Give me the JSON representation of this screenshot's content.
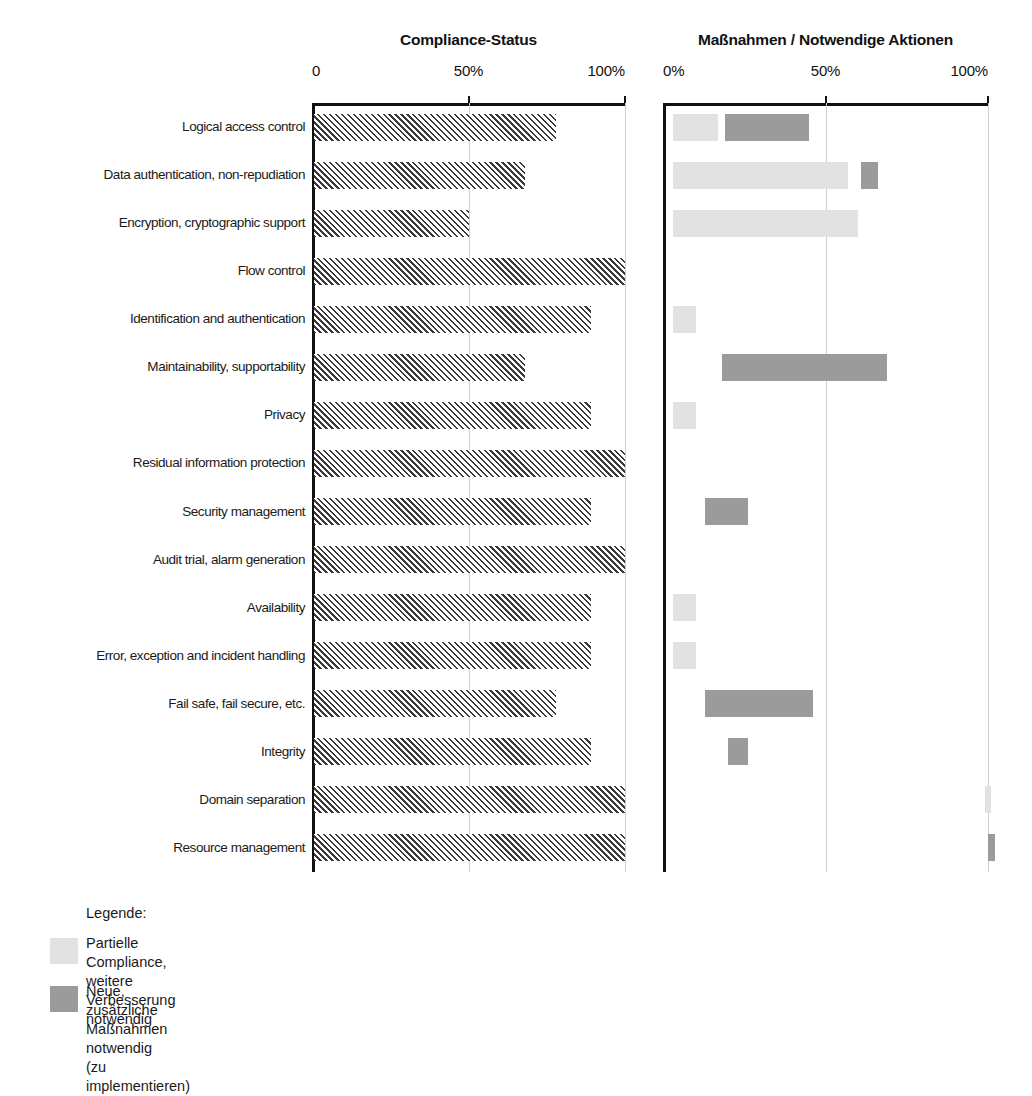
{
  "chart_data": {
    "type": "bar",
    "title": "",
    "orientation": "horizontal",
    "panels": [
      {
        "id": "compliance",
        "title": "Compliance-Status",
        "xlabel": "",
        "ylabel": "",
        "xlim": [
          0,
          100
        ],
        "ticks": [
          {
            "value": 0,
            "label": "0"
          },
          {
            "value": 50,
            "label": "50%"
          },
          {
            "value": 100,
            "label": "100%"
          }
        ],
        "grid": true,
        "series": [
          {
            "name": "Compliance-Status",
            "style": "hatched",
            "values": [
              78,
              68,
              50,
              100,
              89,
              68,
              89,
              100,
              89,
              100,
              89,
              89,
              78,
              89,
              100,
              100
            ]
          }
        ]
      },
      {
        "id": "massnahmen",
        "title": "Maßnahmen / Notwendige Aktionen",
        "xlabel": "",
        "ylabel": "",
        "xlim": [
          0,
          100
        ],
        "ticks": [
          {
            "value": 0,
            "label": "0%"
          },
          {
            "value": 50,
            "label": "50%"
          },
          {
            "value": 100,
            "label": "100%"
          }
        ],
        "grid": true,
        "series": [
          {
            "name": "Partielle Compliance, weitere Verbesserung notwendig",
            "style": "light",
            "bars": [
              {
                "row": 0,
                "start": 3,
                "end": 17
              },
              {
                "row": 1,
                "start": 3,
                "end": 57
              },
              {
                "row": 2,
                "start": 3,
                "end": 60
              },
              {
                "row": 4,
                "start": 3,
                "end": 10
              },
              {
                "row": 6,
                "start": 3,
                "end": 10
              },
              {
                "row": 10,
                "start": 3,
                "end": 10
              },
              {
                "row": 11,
                "start": 3,
                "end": 10
              },
              {
                "row": 14,
                "start": 99,
                "end": 101
              }
            ]
          },
          {
            "name": "Neue, zusätzliche Maßnahmen notwendig (zu implementieren)",
            "style": "dark",
            "bars": [
              {
                "row": 0,
                "start": 19,
                "end": 45
              },
              {
                "row": 1,
                "start": 61,
                "end": 66
              },
              {
                "row": 5,
                "start": 18,
                "end": 69
              },
              {
                "row": 8,
                "start": 13,
                "end": 26
              },
              {
                "row": 12,
                "start": 13,
                "end": 46
              },
              {
                "row": 13,
                "start": 20,
                "end": 26
              },
              {
                "row": 15,
                "start": 100,
                "end": 102
              }
            ]
          }
        ]
      }
    ],
    "categories": [
      "Logical access control",
      "Data authentication, non-repudiation",
      "Encryption, cryptographic support",
      "Flow control",
      "Identification and authentication",
      "Maintainability, supportability",
      "Privacy",
      "Residual information protection",
      "Security management",
      "Audit trial, alarm generation",
      "Availability",
      "Error, exception and incident handling",
      "Fail safe, fail secure, etc.",
      "Integrity",
      "Domain separation",
      "Resource management"
    ],
    "colors": {
      "hatch_line": "#3a3a3a",
      "light_gray": "#e2e2e2",
      "dark_gray": "#9b9b9b",
      "axis": "#111111",
      "gridline": "#cfcfcf",
      "text": "#1a1a1a"
    }
  },
  "legend": {
    "title": "Legende:",
    "items": [
      {
        "swatch": "light_gray",
        "label": "Partielle Compliance, weitere Verbesserung\nnotwendig"
      },
      {
        "swatch": "dark_gray",
        "label": "Neue, zusätzliche Maßnahmen notwendig\n(zu implementieren)"
      }
    ]
  }
}
